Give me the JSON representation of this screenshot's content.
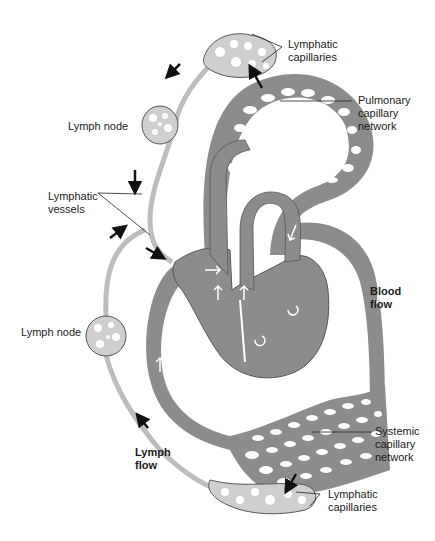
{
  "diagram": {
    "type": "lymphatic and blood circulation",
    "colors": {
      "blood": "#8c8c8c",
      "blood_dark": "#6f6f6f",
      "lymph": "#cfcfcf",
      "outline": "#555555",
      "arrow": "#111111",
      "background": "#ffffff"
    },
    "labels": {
      "lymphatic_capillaries_top": "Lymphatic\ncapillaries",
      "pulmonary_capillary_network": "Pulmonary\ncapillary\nnetwork",
      "lymph_node_top": "Lymph node",
      "lymphatic_vessels": "Lymphatic\nvessels",
      "blood_flow": "Blood\nflow",
      "lymph_node_bottom": "Lymph node",
      "systemic_capillary_network": "Systemic\ncapillary\nnetwork",
      "lymph_flow": "Lymph\nflow",
      "lymphatic_capillaries_bottom": "Lymphatic\ncapillaries"
    }
  }
}
